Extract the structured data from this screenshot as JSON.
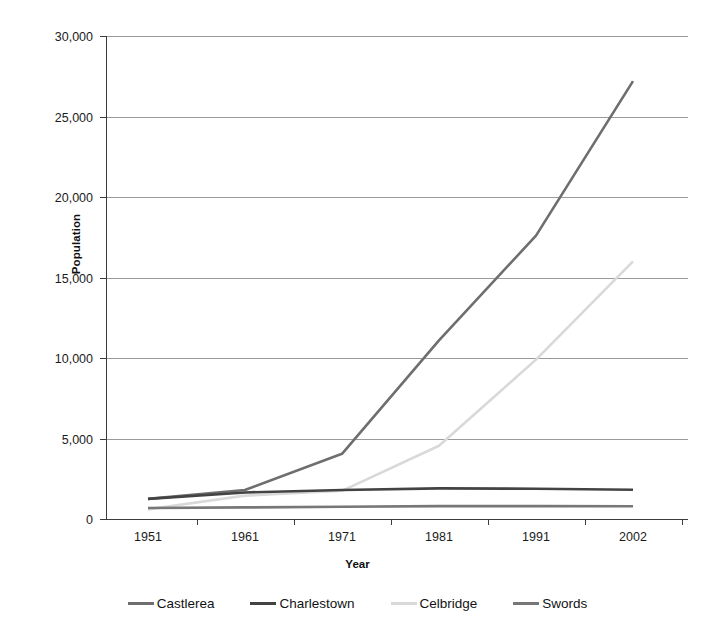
{
  "chart_data": {
    "type": "line",
    "title": "",
    "xlabel": "Year",
    "ylabel": "Population",
    "categories": [
      "1951",
      "1961",
      "1971",
      "1981",
      "1991",
      "2002"
    ],
    "x": [
      1951,
      1961,
      1971,
      1981,
      1991,
      2002
    ],
    "ylim": [
      0,
      30000
    ],
    "xlim": [
      1951,
      2002
    ],
    "ytick_labels": [
      "0",
      "5,000",
      "10,000",
      "15,000",
      "20,000",
      "25,000",
      "30,000"
    ],
    "ytick_values": [
      0,
      5000,
      10000,
      15000,
      20000,
      25000,
      30000
    ],
    "grid": "horizontal",
    "legend_position": "bottom",
    "series": [
      {
        "name": "Castlerea",
        "color": "#6e6e6e",
        "values": [
          1250,
          1800,
          4050,
          11100,
          17600,
          27200
        ]
      },
      {
        "name": "Charlestown",
        "color": "#434343",
        "values": [
          1250,
          1650,
          1800,
          1900,
          1880,
          1820
        ]
      },
      {
        "name": "Celbridge",
        "color": "#d9d9d9",
        "values": [
          600,
          1450,
          1750,
          4550,
          9900,
          16000
        ]
      },
      {
        "name": "Swords",
        "color": "#777777",
        "values": [
          680,
          720,
          760,
          800,
          800,
          790
        ]
      }
    ]
  },
  "legend": {
    "items": [
      {
        "label": "Castlerea"
      },
      {
        "label": "Charlestown"
      },
      {
        "label": "Celbridge"
      },
      {
        "label": "Swords"
      }
    ]
  },
  "axes": {
    "y_title": "Population",
    "x_title": "Year"
  }
}
